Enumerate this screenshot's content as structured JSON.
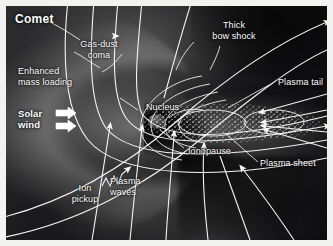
{
  "figure": {
    "title": "Comet",
    "type": "scientific-diagram",
    "frame_color": "#ffffff",
    "background_color": "#0a0a0c",
    "label_color": "#ffffff"
  },
  "labels": {
    "comet": "Comet",
    "gas_dust_coma": "Gas-dust\ncoma",
    "enhanced_mass_loading": "Enhanced\nmass loading",
    "solar_wind": "Solar\nwind",
    "ion_pickup": "Ion\npickup",
    "plasma_waves": "Plasma\nwaves",
    "thick_bow_shock": "Thick\nbow shock",
    "nucleus": "Nucleus",
    "plasma_tail": "Plasma tail",
    "ionopause": "Ionopause",
    "plasma_sheet": "Plasma sheet"
  },
  "icons": {
    "solar_wind_arrow": "block-arrow-right",
    "field_line_arrow": "line-arrowhead",
    "plasma_wave_squiggle": "zigzag-arrow"
  },
  "annotations": {
    "solar_wind_arrow_count": 2,
    "field_line_count": 14,
    "flow_direction": "left-to-right"
  }
}
